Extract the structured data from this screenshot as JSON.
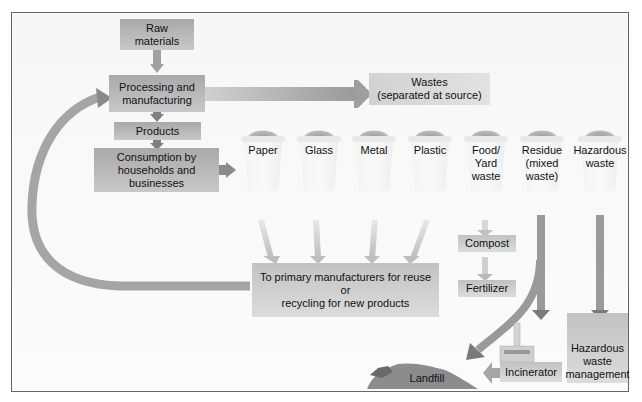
{
  "diagram": {
    "nodes": {
      "raw_materials": "Raw\nmaterials",
      "processing": "Processing and\nmanufacturing",
      "products": "Products",
      "consumption": "Consumption by\nhouseholds and\nbusinesses",
      "wastes": "Wastes\n(separated at source)",
      "recycling": "To primary manufacturers for reuse\nor\nrecycling for new products",
      "compost": "Compost",
      "fertilizer": "Fertilizer",
      "landfill": "Landfill",
      "incinerator": "Incinerator",
      "hazardous_mgmt": "Hazardous\nwaste\nmanagement"
    },
    "bins": [
      {
        "label": "Paper"
      },
      {
        "label": "Glass"
      },
      {
        "label": "Metal"
      },
      {
        "label": "Plastic"
      },
      {
        "label": "Food/\nYard\nwaste"
      },
      {
        "label": "Residue\n(mixed\nwaste)"
      },
      {
        "label": "Hazardous\nwaste"
      }
    ],
    "colors": {
      "box_dark": "#a9a9a9",
      "arrow_dark": "#7a7a7a",
      "arrow_light": "#c8c8c8",
      "border": "#666666"
    }
  }
}
